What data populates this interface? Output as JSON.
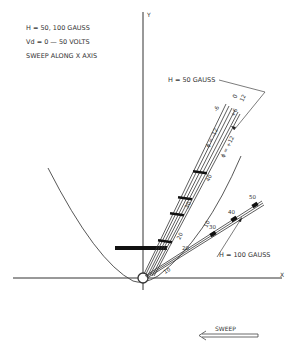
{
  "header_notes": [
    "H = 50, 100 GAUSS",
    "Vd = 0 — 50 VOLTS",
    "SWEEP ALONG X AXIS"
  ],
  "axes": {
    "x_label": "X",
    "y_label": "Y"
  },
  "curves": {
    "h50": {
      "label": "H = 50 GAUSS",
      "phi_neg": "ϕ = -12",
      "phi_neg_small": "-6",
      "phi_pos": "ϕ = +12",
      "phi_pos_small": "+6",
      "tip_labels": [
        "0",
        "12"
      ],
      "voltage_ticks": [
        "10",
        "20",
        "30",
        "40"
      ]
    },
    "h100": {
      "label": "H = 100 GAUSS",
      "voltage_ticks": [
        "10",
        "20",
        "30",
        "40",
        "50"
      ]
    }
  },
  "sweep": {
    "label": "SWEEP",
    "direction": "left"
  },
  "colors": {
    "ink": "#333333",
    "background": "#ffffff"
  }
}
